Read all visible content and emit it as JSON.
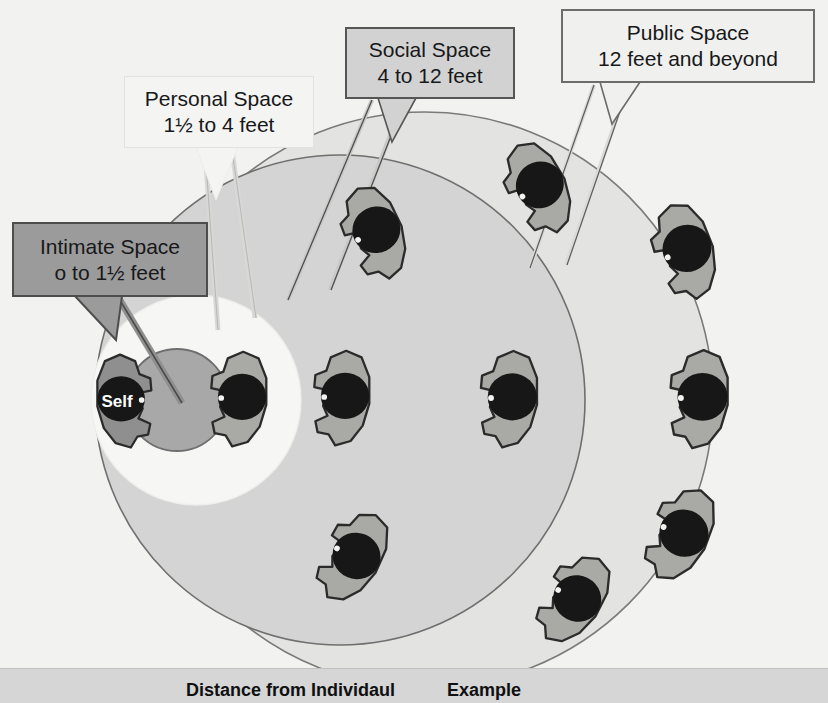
{
  "diagram": {
    "title_zones": "Personal space zones",
    "self_label": "Self",
    "callouts": {
      "intimate": {
        "name": "Intimate Space",
        "range": "o to 1½ feet",
        "text": "Intimate Space\no to 1½ feet",
        "fill": "#9b9b9b",
        "border": "#4d4d4d"
      },
      "personal": {
        "name": "Personal Space",
        "range": "1½ to 4 feet",
        "text": "Personal Space\n1½ to 4 feet",
        "fill": "#f4f4f2",
        "border": "#e2e2e0"
      },
      "social": {
        "name": "Social Space",
        "range": "4 to 12 feet",
        "text": "Social Space\n4 to 12 feet",
        "fill": "#d2d2d2",
        "border": "#565656"
      },
      "public": {
        "name": "Public Space",
        "range": "12 feet and beyond",
        "text": "Public Space\n12 feet and beyond",
        "fill": "#f0f0ee",
        "border": "#6c6c6c"
      }
    },
    "zones": [
      {
        "key": "intimate",
        "fill": "#a8a8a8",
        "stroke": "#6e6e6e"
      },
      {
        "key": "personal",
        "fill": "#f6f6f4",
        "stroke": "#ededeb"
      },
      {
        "key": "social",
        "fill": "#d4d4d4",
        "stroke": "#6f6f6f"
      },
      {
        "key": "public",
        "fill": "#e3e3e1",
        "stroke": "#7a7a7a"
      }
    ],
    "colors": {
      "background": "#f2f2f0",
      "person_body": "#a9a9a5",
      "person_outline": "#2b2b2b",
      "person_head": "#171717",
      "self_body": "#8f8f8f",
      "table_band": "#d6d6d6"
    }
  },
  "table": {
    "headers": [
      "Distance from Individaul",
      "Example"
    ]
  }
}
